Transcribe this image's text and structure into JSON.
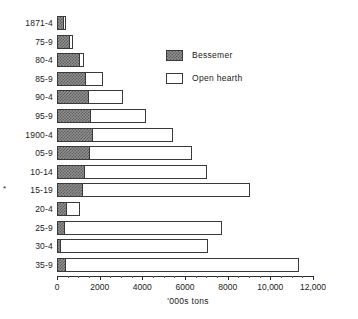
{
  "chart_data": {
    "type": "bar",
    "orientation": "horizontal",
    "title": "",
    "subtitle": "",
    "xlabel": "'000s tons",
    "ylabel": "",
    "xlim": [
      0,
      12000
    ],
    "xticks": [
      0,
      2000,
      4000,
      6000,
      8000,
      10000,
      12000
    ],
    "xticklabels": [
      "0",
      "2000",
      "4000",
      "6000",
      "8000",
      "10,000",
      "12,000"
    ],
    "xtick_minor_step": 500,
    "grid": false,
    "stacked": false,
    "overlay": true,
    "legend_position": "upper-right-inside",
    "categories": [
      "1871-4",
      "75-9",
      "80-4",
      "85-9",
      "90-4",
      "95-9",
      "1900-4",
      "05-9",
      "10-14",
      "15-19",
      "20-4",
      "25-9",
      "30-4",
      "35-9"
    ],
    "category_markers": {
      "15-19": "*"
    },
    "annotations": [
      {
        "text": "*",
        "target_category": "15-19"
      }
    ],
    "series": [
      {
        "name": "Bessemer",
        "fill": "hatched-gray",
        "color": "#8f8f8f",
        "values": [
          330,
          620,
          1080,
          1370,
          1510,
          1600,
          1680,
          1550,
          1320,
          1230,
          490,
          380,
          200,
          420
        ]
      },
      {
        "name": "Open hearth",
        "fill": "white",
        "color": "#ffffff",
        "values": [
          430,
          770,
          1280,
          2170,
          3100,
          4150,
          5450,
          6320,
          7050,
          9050,
          1100,
          7750,
          7100,
          11340
        ]
      }
    ]
  },
  "legend": {
    "items": [
      {
        "label": "Bessemer",
        "swatch": "hatched-gray"
      },
      {
        "label": "Open hearth",
        "swatch": "white"
      }
    ]
  },
  "axis": {
    "x_title": "'000s tons"
  }
}
